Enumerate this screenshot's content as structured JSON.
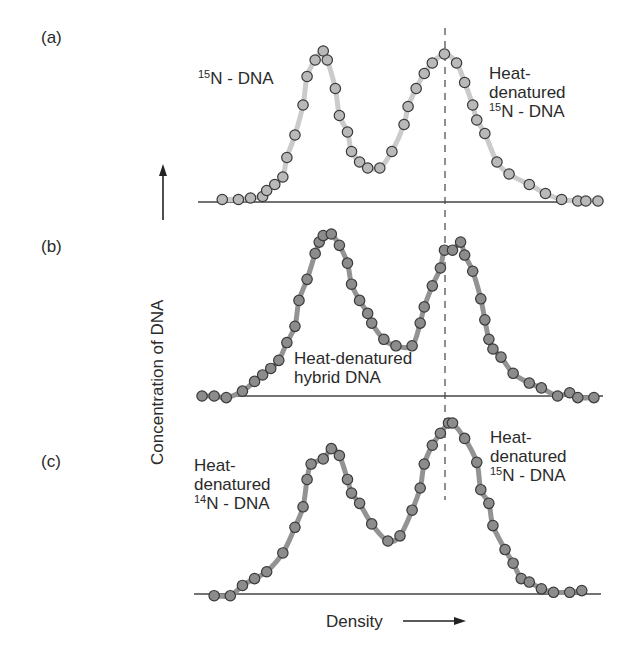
{
  "figure": {
    "panels": [
      {
        "id": "a",
        "label": "(a)",
        "annotations": [
          {
            "lines": [
              {
                "sup": "15",
                "text": "N - DNA"
              }
            ]
          },
          {
            "lines": [
              {
                "text": "Heat-"
              },
              {
                "text": "denatured"
              },
              {
                "sup": "15",
                "text": "N - DNA"
              }
            ]
          }
        ]
      },
      {
        "id": "b",
        "label": "(b)",
        "annotations": [
          {
            "lines": [
              {
                "text": "Heat-denatured"
              },
              {
                "text": "hybrid DNA"
              }
            ]
          }
        ]
      },
      {
        "id": "c",
        "label": "(c)",
        "annotations": [
          {
            "lines": [
              {
                "text": "Heat-"
              },
              {
                "text": "denatured"
              },
              {
                "sup": "14",
                "text": "N - DNA"
              }
            ]
          },
          {
            "lines": [
              {
                "text": "Heat-"
              },
              {
                "text": "denatured"
              },
              {
                "sup": "15",
                "text": "N - DNA"
              }
            ]
          }
        ]
      }
    ],
    "y_axis_label": "Concentration of DNA",
    "x_axis_label": "Density",
    "colors": {
      "panel_a_dot": "#b9b9b9",
      "panel_a_curve": "#cbcbcb",
      "panel_bc_dot": "#8c8c8c",
      "panel_bc_curve": "#939393",
      "dot_stroke": "#3a3a3a",
      "baseline": "#444444",
      "dashed": "#444444"
    }
  },
  "chart_data": {
    "type": "scatter",
    "title": "",
    "xlabel": "Density",
    "ylabel": "Concentration of DNA",
    "grid": false,
    "note": "Three stacked density-gradient profiles; values in pixel-derived relative units (x: 0-100 density, y: 0-100 relative concentration). Dashed vertical reference line at x≈61.",
    "reference_line_x": 61,
    "series": [
      {
        "name": "(a) 15N-DNA + heat-denatured 15N-DNA",
        "x": [
          6,
          10,
          13,
          16,
          17,
          19,
          21,
          22,
          24,
          26,
          27,
          29,
          31,
          32,
          34,
          35,
          37,
          38,
          40,
          42,
          45,
          48,
          51,
          52,
          54,
          56,
          58,
          61,
          64,
          66,
          68,
          69,
          71,
          74,
          77,
          82,
          86,
          90,
          94,
          96,
          99
        ],
        "y": [
          1,
          1,
          2,
          3,
          7,
          11,
          16,
          29,
          44,
          64,
          83,
          94,
          100,
          94,
          75,
          57,
          46,
          33,
          26,
          22,
          22,
          33,
          51,
          63,
          75,
          85,
          92,
          98,
          92,
          79,
          64,
          54,
          45,
          26,
          18,
          11,
          5,
          1,
          0,
          0,
          0
        ]
      },
      {
        "name": "(b) heat-denatured hybrid DNA",
        "x": [
          1,
          4,
          7,
          11,
          14,
          16,
          18,
          20,
          22,
          24,
          25,
          27,
          29,
          30,
          31,
          33,
          35,
          37,
          38,
          40,
          42,
          43,
          46,
          49,
          53,
          55,
          56,
          58,
          60,
          61,
          63,
          65,
          66,
          68,
          70,
          71,
          72,
          73,
          75,
          78,
          82,
          85,
          89,
          92,
          94,
          98
        ],
        "y": [
          0,
          0,
          -1,
          3,
          9,
          13,
          17,
          22,
          33,
          43,
          59,
          72,
          88,
          95,
          99,
          100,
          93,
          82,
          69,
          59,
          51,
          45,
          35,
          31,
          31,
          45,
          55,
          68,
          79,
          90,
          90,
          95,
          87,
          77,
          60,
          47,
          35,
          29,
          24,
          14,
          8,
          5,
          0,
          2,
          -1,
          -1
        ]
      },
      {
        "name": "(c) heat-denatured 14N-DNA + heat-denatured 15N-DNA",
        "x": [
          4,
          8,
          11,
          14,
          17,
          21,
          24,
          26,
          27,
          28,
          31,
          33,
          35,
          37,
          38,
          40,
          43,
          47,
          50,
          53,
          55,
          56,
          58,
          60,
          62,
          63,
          66,
          69,
          70,
          72,
          73,
          76,
          78,
          80,
          82,
          85,
          88,
          92,
          95
        ],
        "y": [
          -1,
          -1,
          5,
          9,
          13,
          24,
          39,
          51,
          67,
          76,
          79,
          85,
          81,
          67,
          59,
          53,
          41,
          31,
          34,
          49,
          62,
          76,
          87,
          94,
          100,
          100,
          91,
          77,
          61,
          53,
          40,
          26,
          18,
          9,
          7,
          3,
          1,
          1,
          2
        ]
      }
    ],
    "ylim": [
      0,
      100
    ],
    "xlim": [
      0,
      100
    ],
    "legend": "none (inline annotations)"
  }
}
